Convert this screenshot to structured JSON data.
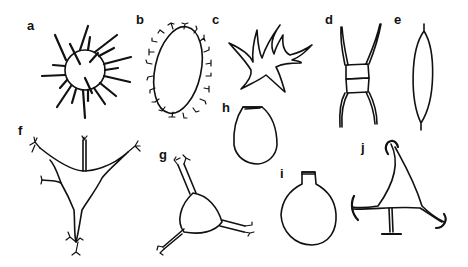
{
  "figure": {
    "panels": [
      {
        "label": "a",
        "shape": "spiny-sphere"
      },
      {
        "label": "b",
        "shape": "ornamented-ellipse"
      },
      {
        "label": "c",
        "shape": "star-with-processes"
      },
      {
        "label": "d",
        "shape": "two-segment-with-horns"
      },
      {
        "label": "e",
        "shape": "spindle"
      },
      {
        "label": "f",
        "shape": "branched-tripod"
      },
      {
        "label": "g",
        "shape": "triangular-with-three-arms"
      },
      {
        "label": "h",
        "shape": "ovoid-with-opening"
      },
      {
        "label": "i",
        "shape": "flask"
      },
      {
        "label": "j",
        "shape": "triangular-with-hooked-tips"
      }
    ]
  }
}
